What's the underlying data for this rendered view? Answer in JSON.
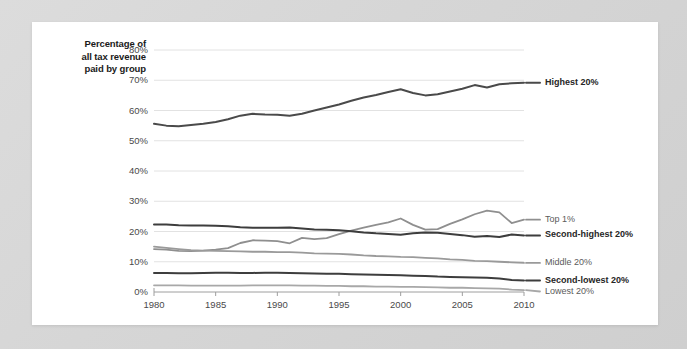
{
  "card": {
    "background": "#ffffff",
    "backdrop_color": "#d8d8d8"
  },
  "chart_data": {
    "type": "line",
    "title": "",
    "subtitle": "",
    "xlabel": "",
    "ylabel": "Percentage of all tax revenue paid by group",
    "ylabel_lines": [
      "Percentage of",
      "all tax revenue",
      "paid by group"
    ],
    "xlim": [
      1980,
      2010
    ],
    "ylim": [
      0,
      80
    ],
    "grid": true,
    "grid_axis": "y",
    "legend_position": "right-inline",
    "x_ticks": [
      1980,
      1985,
      1990,
      1995,
      2000,
      2005,
      2010
    ],
    "x_tick_labels": [
      "1980",
      "1985",
      "1990",
      "1995",
      "2000",
      "2005",
      "2010"
    ],
    "y_ticks": [
      0,
      10,
      20,
      30,
      40,
      50,
      60,
      70,
      80
    ],
    "y_tick_labels": [
      "0%",
      "10%",
      "20%",
      "30%",
      "40%",
      "50%",
      "60%",
      "70%",
      "80%"
    ],
    "x": [
      1980,
      1981,
      1982,
      1983,
      1984,
      1985,
      1986,
      1987,
      1988,
      1989,
      1990,
      1991,
      1992,
      1993,
      1994,
      1995,
      1996,
      1997,
      1998,
      1999,
      2000,
      2001,
      2002,
      2003,
      2004,
      2005,
      2006,
      2007,
      2008,
      2009,
      2010
    ],
    "series": [
      {
        "name": "Highest 20%",
        "label": "Highest 20%",
        "color": "#4a4a4a",
        "width": 2.0,
        "emphasis": "strong",
        "values": [
          55.6,
          55.0,
          54.8,
          55.2,
          55.6,
          56.2,
          57.1,
          58.3,
          58.9,
          58.7,
          58.6,
          58.3,
          58.9,
          60.0,
          61.0,
          62.0,
          63.2,
          64.3,
          65.1,
          66.1,
          67.0,
          65.8,
          65.0,
          65.4,
          66.3,
          67.2,
          68.4,
          67.6,
          68.7,
          69.0,
          69.2
        ]
      },
      {
        "name": "Top 1%",
        "label": "Top 1%",
        "color": "#8f8f8f",
        "width": 1.8,
        "emphasis": "light",
        "values": [
          14.2,
          14.0,
          13.6,
          13.5,
          13.7,
          14.0,
          14.5,
          16.2,
          17.1,
          17.0,
          16.8,
          16.1,
          17.9,
          17.5,
          17.8,
          19.1,
          20.3,
          21.3,
          22.2,
          23.0,
          24.3,
          22.2,
          20.6,
          20.8,
          22.5,
          24.0,
          25.7,
          26.9,
          26.3,
          22.8,
          23.9
        ]
      },
      {
        "name": "Second-highest 20%",
        "label": "Second-highest 20%",
        "color": "#3d3d3d",
        "width": 2.0,
        "emphasis": "strong",
        "values": [
          22.3,
          22.3,
          22.1,
          22.0,
          22.0,
          21.9,
          21.7,
          21.4,
          21.2,
          21.2,
          21.2,
          21.3,
          21.0,
          20.7,
          20.6,
          20.4,
          20.1,
          19.7,
          19.4,
          19.2,
          18.9,
          19.4,
          19.7,
          19.6,
          19.2,
          18.8,
          18.3,
          18.5,
          18.2,
          19.0,
          18.7
        ]
      },
      {
        "name": "Middle 20%",
        "label": "Middle 20%",
        "color": "#9a9a9a",
        "width": 1.8,
        "emphasis": "light",
        "values": [
          15.0,
          14.6,
          14.2,
          13.8,
          13.7,
          13.6,
          13.5,
          13.4,
          13.3,
          13.3,
          13.2,
          13.2,
          13.0,
          12.8,
          12.7,
          12.6,
          12.4,
          12.1,
          11.9,
          11.8,
          11.6,
          11.5,
          11.3,
          11.1,
          10.8,
          10.6,
          10.3,
          10.2,
          10.0,
          9.8,
          9.6
        ]
      },
      {
        "name": "Second-lowest 20%",
        "label": "Second-lowest 20%",
        "color": "#3d3d3d",
        "width": 2.0,
        "emphasis": "strong",
        "values": [
          6.3,
          6.3,
          6.2,
          6.2,
          6.3,
          6.4,
          6.4,
          6.3,
          6.3,
          6.4,
          6.4,
          6.3,
          6.2,
          6.1,
          6.0,
          6.0,
          5.9,
          5.8,
          5.7,
          5.6,
          5.5,
          5.4,
          5.3,
          5.1,
          5.0,
          4.9,
          4.8,
          4.7,
          4.5,
          4.0,
          3.8
        ]
      },
      {
        "name": "Lowest 20%",
        "label": "Lowest 20%",
        "color": "#a8a8a8",
        "width": 1.8,
        "emphasis": "light",
        "values": [
          2.2,
          2.2,
          2.2,
          2.1,
          2.1,
          2.1,
          2.1,
          2.1,
          2.2,
          2.2,
          2.2,
          2.2,
          2.1,
          2.1,
          2.0,
          2.0,
          1.9,
          1.9,
          1.8,
          1.8,
          1.7,
          1.7,
          1.6,
          1.5,
          1.4,
          1.4,
          1.3,
          1.2,
          1.1,
          0.8,
          0.6
        ]
      }
    ]
  }
}
